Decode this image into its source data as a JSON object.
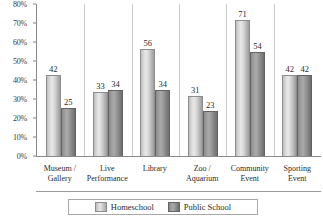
{
  "chart_data": {
    "type": "bar",
    "title": "",
    "xlabel": "",
    "ylabel": "",
    "ylim": [
      0,
      80
    ],
    "ytick_labels": [
      "80%",
      "70%",
      "60%",
      "50%",
      "40%",
      "30%",
      "20%",
      "10%",
      "0%"
    ],
    "ytick_values": [
      80,
      70,
      60,
      50,
      40,
      30,
      20,
      10,
      0
    ],
    "grid": false,
    "legend_position": "bottom",
    "categories": [
      "Museum /\nGallery",
      "Live\nPerformance",
      "Library",
      "Zoo /\nAquarium",
      "Community\nEvent",
      "Sporting\nEvent"
    ],
    "category_lines": [
      [
        "Museum /",
        "Gallery"
      ],
      [
        "Live",
        "Performance"
      ],
      [
        "Library",
        ""
      ],
      [
        "Zoo /",
        "Aquarium"
      ],
      [
        "Community",
        "Event"
      ],
      [
        "Sporting",
        "Event"
      ]
    ],
    "series": [
      {
        "name": "Homeschool",
        "color": "#d6d6d6",
        "values": [
          42,
          33,
          56,
          31,
          71,
          42
        ]
      },
      {
        "name": "Public School",
        "color": "#8a8a8a",
        "values": [
          25,
          34,
          34,
          23,
          54,
          42
        ]
      }
    ]
  },
  "legend": {
    "items": [
      {
        "label": "Homeschool"
      },
      {
        "label": "Public School"
      }
    ]
  }
}
